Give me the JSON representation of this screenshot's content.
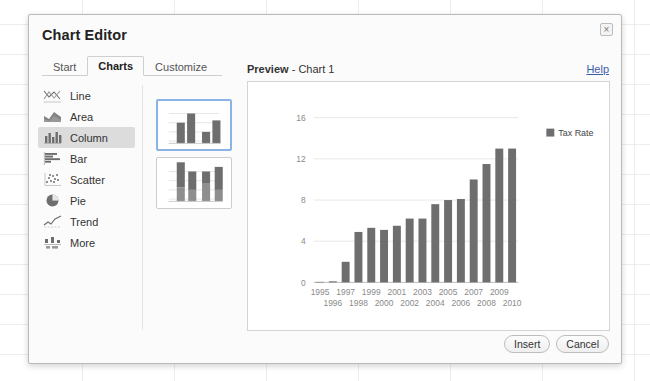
{
  "window": {
    "title": "Chart Editor",
    "close_label": "×"
  },
  "tabs": [
    {
      "label": "Start",
      "active": false
    },
    {
      "label": "Charts",
      "active": true
    },
    {
      "label": "Customize",
      "active": false
    }
  ],
  "chart_types": [
    {
      "label": "Line",
      "icon": "line-chart-icon",
      "selected": false
    },
    {
      "label": "Area",
      "icon": "area-chart-icon",
      "selected": false
    },
    {
      "label": "Column",
      "icon": "column-chart-icon",
      "selected": true
    },
    {
      "label": "Bar",
      "icon": "bar-chart-icon",
      "selected": false
    },
    {
      "label": "Scatter",
      "icon": "scatter-chart-icon",
      "selected": false
    },
    {
      "label": "Pie",
      "icon": "pie-chart-icon",
      "selected": false
    },
    {
      "label": "Trend",
      "icon": "trend-chart-icon",
      "selected": false
    },
    {
      "label": "More",
      "icon": "more-charts-icon",
      "selected": false
    }
  ],
  "thumbnails": [
    {
      "name": "grouped-column-thumbnail",
      "selected": true
    },
    {
      "name": "stacked-column-thumbnail",
      "selected": false
    }
  ],
  "preview": {
    "label": "Preview",
    "separator": " - ",
    "chart_name": "Chart 1",
    "help_label": "Help"
  },
  "footer": {
    "insert_label": "Insert",
    "cancel_label": "Cancel"
  },
  "colors": {
    "bar": "#6e6e6e",
    "gridline": "#e8e8e8",
    "axis_text": "#8a8a8a",
    "selection": "#8ab4e8",
    "selected_row": "#dcdcdc",
    "link": "#3b5ea8"
  },
  "chart_data": {
    "type": "bar",
    "title": "",
    "xlabel": "",
    "ylabel": "",
    "ylim": [
      0,
      16
    ],
    "yticks": [
      0,
      4,
      8,
      12,
      16
    ],
    "grid": true,
    "legend": [
      "Tax Rate"
    ],
    "legend_position": "right",
    "categories": [
      "1995",
      "1996",
      "1997",
      "1998",
      "1999",
      "2000",
      "2001",
      "2002",
      "2003",
      "2004",
      "2005",
      "2006",
      "2007",
      "2008",
      "2009",
      "2010"
    ],
    "series": [
      {
        "name": "Tax Rate",
        "values": [
          0.05,
          0.1,
          2.0,
          4.9,
          5.3,
          5.1,
          5.5,
          6.2,
          6.2,
          7.6,
          8.0,
          8.1,
          10.0,
          11.5,
          13.0,
          13.0
        ]
      }
    ]
  }
}
